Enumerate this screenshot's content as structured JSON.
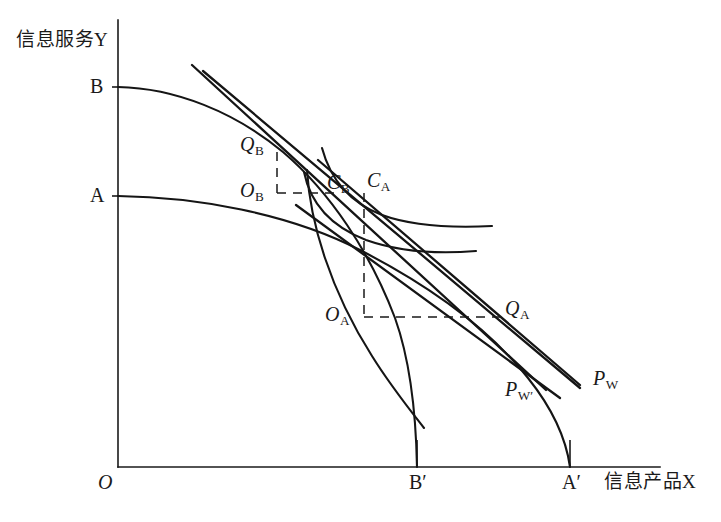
{
  "figure": {
    "kind": "economics-diagram",
    "background_color": "#ffffff",
    "ink_color": "#1a1a1a"
  },
  "axes": {
    "y_axis_label": "信息服务Y",
    "x_axis_label": "信息产品X",
    "origin_label": "O",
    "y_ticks": [
      {
        "label": "B",
        "y_px": 87
      },
      {
        "label": "A",
        "y_px": 196
      }
    ],
    "x_ticks": [
      {
        "label": "B′",
        "x_px": 417
      },
      {
        "label": "A′",
        "x_px": 570
      }
    ],
    "origin_px": {
      "x": 118,
      "y": 467
    },
    "x_axis_end_px": 660,
    "y_axis_top_px": 20
  },
  "points": [
    {
      "name": "Q_B",
      "base": "Q",
      "sub": "B",
      "x_px": 277,
      "y_px": 148,
      "role": "production-point-country-B"
    },
    {
      "name": "O_B",
      "base": "O",
      "sub": "B",
      "x_px": 277,
      "y_px": 193,
      "role": "corner-country-B"
    },
    {
      "name": "C_B",
      "base": "C",
      "sub": "B",
      "x_px": 337,
      "y_px": 193,
      "role": "consumption-point-country-B"
    },
    {
      "name": "C_A",
      "base": "C",
      "sub": "A",
      "x_px": 364,
      "y_px": 193,
      "role": "consumption-point-country-A"
    },
    {
      "name": "O_A",
      "base": "O",
      "sub": "A",
      "x_px": 364,
      "y_px": 317,
      "role": "corner-country-A"
    },
    {
      "name": "Q_A",
      "base": "Q",
      "sub": "A",
      "x_px": 500,
      "y_px": 317,
      "role": "production-point-country-A"
    }
  ],
  "price_lines": [
    {
      "name": "P_W",
      "base": "P",
      "sub": "W",
      "label_x_px": 593,
      "label_y_px": 368,
      "role": "world-price-line"
    },
    {
      "name": "P_W'",
      "base": "P",
      "sub": "W′",
      "label_x_px": 505,
      "label_y_px": 379,
      "role": "world-price-line-prime"
    }
  ],
  "curves": {
    "ppf_B": {
      "name": "ppf-country-B",
      "from": "B",
      "to": "B′"
    },
    "ppf_A": {
      "name": "ppf-country-A",
      "from": "A",
      "to": "A′"
    },
    "indifference_B": {
      "name": "indifference-curve-B"
    },
    "indifference_A": {
      "name": "indifference-curve-A"
    }
  }
}
